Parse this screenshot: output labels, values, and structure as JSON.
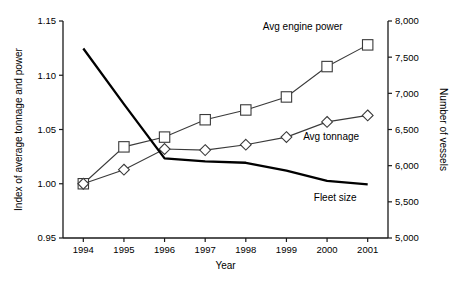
{
  "chart_data": {
    "type": "line",
    "title": "",
    "xlabel": "Year",
    "ylabel": "Index of average tonnage and power",
    "y2label": "Number of vessels",
    "categories": [
      "1994",
      "1995",
      "1996",
      "1997",
      "1998",
      "1999",
      "2000",
      "2001"
    ],
    "x": [
      1994,
      1995,
      1996,
      1997,
      1998,
      1999,
      2000,
      2001
    ],
    "ylim": [
      0.95,
      1.15
    ],
    "y2lim": [
      5000,
      8000
    ],
    "yticks": [
      "0.95",
      "1.00",
      "1.05",
      "1.10",
      "1.15"
    ],
    "ytick_values": [
      0.95,
      1.0,
      1.05,
      1.1,
      1.15
    ],
    "y2ticks": [
      "5,000",
      "5,500",
      "6,000",
      "6,500",
      "7,000",
      "7,500",
      "8,000"
    ],
    "y2tick_values": [
      5000,
      5500,
      6000,
      6500,
      7000,
      7500,
      8000
    ],
    "grid": false,
    "legend": "inline-annotations",
    "series": [
      {
        "name": "Avg engine power",
        "axis": "left",
        "marker": "square",
        "values": [
          1.0,
          1.034,
          1.043,
          1.059,
          1.068,
          1.08,
          1.108,
          1.128
        ]
      },
      {
        "name": "Avg tonnage",
        "axis": "left",
        "marker": "diamond",
        "values": [
          1.0,
          1.013,
          1.032,
          1.031,
          1.036,
          1.043,
          1.057,
          1.063
        ]
      },
      {
        "name": "Fleet size",
        "axis": "right",
        "marker": "none",
        "values": [
          7620,
          6850,
          6100,
          6060,
          6040,
          5930,
          5790,
          5740
        ]
      }
    ],
    "annotations": [
      {
        "text": "Avg engine power",
        "x": 1999.4,
        "y": 1.142,
        "anchor": "middle"
      },
      {
        "text": "Avg tonnage",
        "x": 2000.1,
        "y": 1.04,
        "anchor": "middle"
      },
      {
        "text": "Fleet size",
        "x": 2000.2,
        "y": 0.9845,
        "anchor": "middle"
      }
    ]
  },
  "colors": {
    "axis": "#1a1a1a",
    "thin_series": "#3a3a3a",
    "thick_series": "#000000",
    "marker_fill": "#ffffff",
    "background": "#ffffff"
  }
}
